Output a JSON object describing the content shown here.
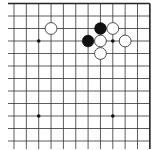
{
  "board": {
    "size": 19,
    "view": {
      "col_start": 8,
      "col_end": 19,
      "row_start": 1,
      "row_end": 12,
      "shows_top_edge": true,
      "shows_right_edge": true
    },
    "grid": {
      "origin_x": 14,
      "origin_y": 3.5,
      "spacing_x": 12.35,
      "spacing_y": 12.5,
      "line_color": "#333333",
      "edge_color": "#222222",
      "background": "#ffffff"
    },
    "star_points": [
      {
        "col": 10,
        "row": 4
      },
      {
        "col": 16,
        "row": 4
      },
      {
        "col": 10,
        "row": 10
      },
      {
        "col": 16,
        "row": 10
      }
    ],
    "stones": [
      {
        "color": "white",
        "col": 11,
        "row": 3
      },
      {
        "color": "black",
        "col": 15,
        "row": 3
      },
      {
        "color": "white",
        "col": 16,
        "row": 3
      },
      {
        "color": "black",
        "col": 14,
        "row": 4
      },
      {
        "color": "white",
        "col": 15,
        "row": 4
      },
      {
        "color": "white",
        "col": 17,
        "row": 4
      },
      {
        "color": "white",
        "col": 15,
        "row": 5
      }
    ],
    "colors": {
      "black_stone": "#111111",
      "white_stone_fill": "#ffffff",
      "white_stone_stroke": "#222222"
    }
  }
}
